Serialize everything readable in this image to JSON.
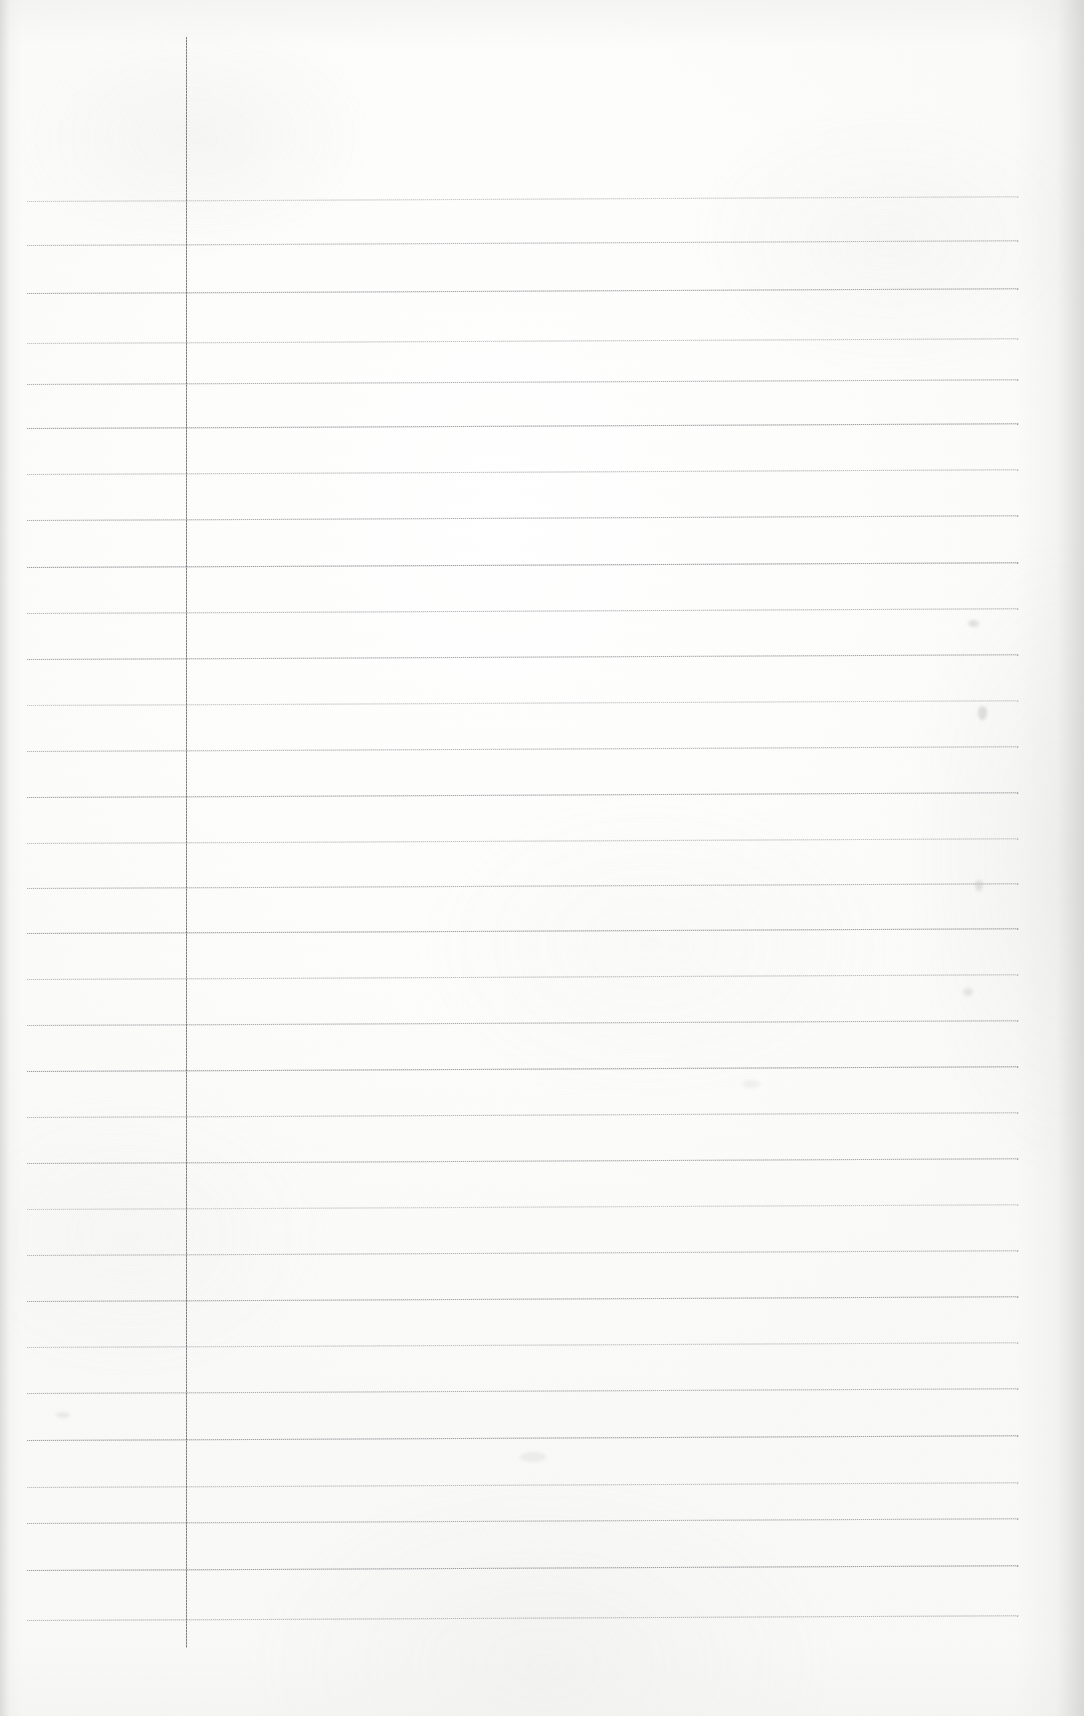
{
  "document": {
    "kind": "scanned-page",
    "title": "Blank ruled notepad page",
    "content_text": "",
    "page_width": 1084,
    "page_height": 1716,
    "paper_color": "#fcfcfb",
    "paper_edge_shadow_color": "#c6c6c4"
  },
  "ruling": {
    "rule_color": "#9a9a9e",
    "rule_count": 29,
    "rule_left_x": 27,
    "rule_right_x": 1019,
    "rule_width": 992,
    "first_rule_y": 201,
    "last_rule_y": 1620,
    "rule_spacing": 50.7,
    "rule_thickness": 1,
    "skew_degrees": -0.28,
    "rule_y_positions": [
      201,
      245,
      293,
      343,
      384,
      428,
      474,
      520,
      567,
      613,
      659,
      705,
      751,
      797,
      843,
      888,
      933,
      979,
      1025,
      1071,
      1117,
      1163,
      1209,
      1255,
      1301,
      1347,
      1393,
      1440,
      1487,
      1523,
      1570,
      1620
    ]
  },
  "margin_rule": {
    "name": "vertical-margin-line",
    "color": "#7e7e83",
    "x": 186,
    "top_y": 37,
    "bottom_y": 1648,
    "thickness": 1
  },
  "marks": {
    "label": "scan artifacts",
    "specks": [
      {
        "x": 968,
        "y": 620,
        "w": 11,
        "h": 7,
        "color": "rgba(186,186,184,0.40)"
      },
      {
        "x": 978,
        "y": 706,
        "w": 9,
        "h": 14,
        "color": "rgba(182,182,180,0.42)"
      },
      {
        "x": 975,
        "y": 880,
        "w": 8,
        "h": 11,
        "color": "rgba(188,188,186,0.38)"
      },
      {
        "x": 963,
        "y": 988,
        "w": 10,
        "h": 8,
        "color": "rgba(190,190,188,0.34)"
      },
      {
        "x": 56,
        "y": 1412,
        "w": 14,
        "h": 6,
        "color": "rgba(196,196,194,0.30)"
      },
      {
        "x": 520,
        "y": 1452,
        "w": 26,
        "h": 10,
        "color": "rgba(198,198,196,0.24)"
      },
      {
        "x": 742,
        "y": 1080,
        "w": 18,
        "h": 8,
        "color": "rgba(200,200,198,0.22)"
      }
    ]
  },
  "regions": {
    "header_area_label": "unruled header space",
    "margin_column_label": "left margin column",
    "body_area_label": "ruled writing area",
    "footer_area_label": "unruled footer space"
  }
}
